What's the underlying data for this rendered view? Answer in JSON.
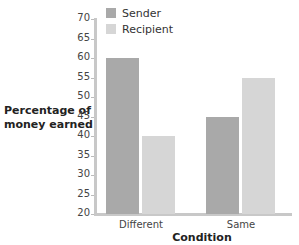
{
  "chart_data": {
    "type": "bar",
    "title": "",
    "xlabel": "Condition",
    "ylabel": "Percentage of\nmoney earned",
    "categories": [
      "Different",
      "Same"
    ],
    "series": [
      {
        "name": "Sender",
        "values": [
          60,
          45
        ],
        "color": "#a9a9a9"
      },
      {
        "name": "Recipient",
        "values": [
          40,
          55
        ],
        "color": "#d6d6d6"
      }
    ],
    "ylim": [
      20,
      70
    ],
    "yticks": [
      70,
      65,
      60,
      55,
      50,
      45,
      40,
      35,
      30,
      25,
      20
    ],
    "grid": false,
    "legend_position": "top-left inside"
  }
}
